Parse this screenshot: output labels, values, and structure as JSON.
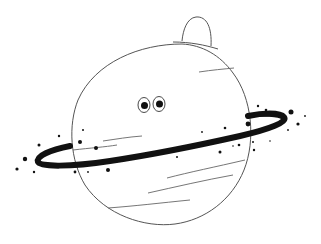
{
  "illustration": {
    "subject": "Cartoon ringed planet with eyes",
    "colors": {
      "background": "#ffffff",
      "outline": "#555555",
      "ring": "#111111",
      "eyes": "#111111"
    },
    "parts": [
      "planet-body",
      "top-bump",
      "eyes",
      "ring",
      "surface-lines",
      "star-dots"
    ]
  }
}
